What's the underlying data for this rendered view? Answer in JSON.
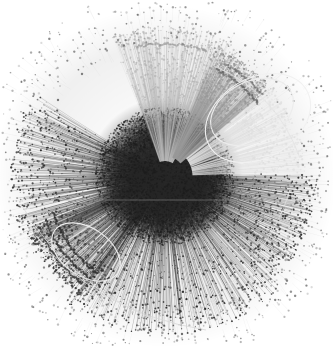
{
  "figure": {
    "type": "network-graph",
    "title": "",
    "caption": "",
    "background_color": "#ffffff",
    "width": 333,
    "height": 347
  },
  "chart_data": {
    "type": "scatter",
    "title": "",
    "subtitle": "",
    "xlabel": "",
    "ylabel": "",
    "xlim": [
      0,
      333
    ],
    "ylim": [
      0,
      347
    ],
    "grid": false,
    "legend_position": "none",
    "layout": "radial-force-directed-hairball",
    "node_count_estimate": 9000,
    "edge_count_estimate": 26000,
    "center": {
      "x": 165,
      "y": 176
    },
    "core_radius": 66,
    "outer_radius": 162,
    "colors": {
      "background": "#ffffff",
      "core_dark": "#262626",
      "node_dark": "#1c1c1c",
      "node_mid": "#555555",
      "node_light": "#b4b4b4",
      "edge_dark": "#3a3a3a",
      "edge_light": "#c9c9c9",
      "halo_faint": "#e4e4e4",
      "crescent_faint": "#ededed"
    },
    "clusters": [
      {
        "name": "dense-core",
        "angle_start": 0,
        "angle_end": 360,
        "radius_in": 0,
        "radius_out": 66,
        "tone": "#262626",
        "density": 1.0,
        "node_size": 0.85
      },
      {
        "name": "north-light-fan",
        "angle_start": 250,
        "angle_end": 300,
        "radius_in": 30,
        "radius_out": 150,
        "tone": "#b9b9b9",
        "density": 0.55,
        "node_size": 0.9
      },
      {
        "name": "north-east-light-fan",
        "angle_start": 292,
        "angle_end": 320,
        "radius_in": 40,
        "radius_out": 138,
        "tone": "#9a9a9a",
        "density": 0.5,
        "node_size": 0.9
      },
      {
        "name": "east-crescent-faint",
        "angle_start": 320,
        "angle_end": 358,
        "radius_in": 55,
        "radius_out": 140,
        "tone": "#e0e0e0",
        "density": 0.22,
        "node_size": 0.8
      },
      {
        "name": "west-dark-fan",
        "angle_start": 150,
        "angle_end": 210,
        "radius_in": 30,
        "radius_out": 155,
        "tone": "#303030",
        "density": 0.85,
        "node_size": 0.9
      },
      {
        "name": "south-west-comb",
        "angle_start": 120,
        "angle_end": 160,
        "radius_in": 60,
        "radius_out": 148,
        "tone": "#3a3a3a",
        "density": 0.8,
        "node_size": 0.95
      },
      {
        "name": "south-dark-fan",
        "angle_start": 45,
        "angle_end": 130,
        "radius_in": 30,
        "radius_out": 160,
        "tone": "#2c2c2c",
        "density": 0.9,
        "node_size": 0.9
      },
      {
        "name": "east-dark-fan",
        "angle_start": 0,
        "angle_end": 45,
        "radius_in": 30,
        "radius_out": 152,
        "tone": "#2e2e2e",
        "density": 0.85,
        "node_size": 0.9
      }
    ],
    "arc_bands": [
      {
        "name": "sw-comb-band-1",
        "cx": 165,
        "cy": 176,
        "r": 118,
        "angle_start": 125,
        "angle_end": 162,
        "count": 58,
        "tone": "#2e2e2e"
      },
      {
        "name": "sw-comb-band-2",
        "cx": 165,
        "cy": 176,
        "r": 127,
        "angle_start": 126,
        "angle_end": 160,
        "count": 54,
        "tone": "#343434"
      },
      {
        "name": "sw-comb-band-3",
        "cx": 165,
        "cy": 176,
        "r": 136,
        "angle_start": 128,
        "angle_end": 158,
        "count": 48,
        "tone": "#3a3a3a"
      },
      {
        "name": "ne-band-1",
        "cx": 165,
        "cy": 176,
        "r": 118,
        "angle_start": 296,
        "angle_end": 322,
        "count": 42,
        "tone": "#6a6a6a"
      },
      {
        "name": "ne-band-2",
        "cx": 165,
        "cy": 176,
        "r": 127,
        "angle_start": 298,
        "angle_end": 320,
        "count": 38,
        "tone": "#757575"
      },
      {
        "name": "n-band-1",
        "cx": 165,
        "cy": 176,
        "r": 132,
        "angle_start": 258,
        "angle_end": 288,
        "count": 44,
        "tone": "#9e9e9e"
      }
    ],
    "crescents": [
      {
        "name": "east-lens",
        "cx": 252,
        "cy": 112,
        "rx": 44,
        "ry": 30,
        "rotation": -28,
        "stroke": "#ececec"
      },
      {
        "name": "east-lens-outer",
        "cx": 258,
        "cy": 118,
        "rx": 56,
        "ry": 40,
        "rotation": -30,
        "stroke": "#f1f1f1"
      },
      {
        "name": "sw-lens",
        "cx": 86,
        "cy": 252,
        "rx": 38,
        "ry": 24,
        "rotation": 34,
        "stroke": "#eeeeee"
      }
    ],
    "horizontal_streak": {
      "name": "equatorial-light-line",
      "y": 200,
      "x_start": 62,
      "x_end": 282,
      "color": "#9e9e9e",
      "opacity": 0.55
    },
    "long_arcs": [
      {
        "name": "sw-long-arc",
        "from": [
          28,
          226
        ],
        "ctrl": [
          92,
          312
        ],
        "to": [
          206,
          330
        ],
        "stroke": "#d8d8d8"
      },
      {
        "name": "w-long-arc",
        "from": [
          22,
          206
        ],
        "ctrl": [
          70,
          286
        ],
        "to": [
          160,
          322
        ],
        "stroke": "#dcdcdc"
      },
      {
        "name": "ne-long-arc",
        "from": [
          214,
          66
        ],
        "ctrl": [
          276,
          92
        ],
        "to": [
          300,
          158
        ],
        "stroke": "#e2e2e2"
      },
      {
        "name": "se-long-arc",
        "from": [
          290,
          190
        ],
        "ctrl": [
          268,
          262
        ],
        "to": [
          196,
          312
        ],
        "stroke": "#e0e0e0"
      }
    ],
    "outlier_nodes": [
      {
        "x": 46,
        "y": 128,
        "size": 1.3,
        "tone": "#4a4a4a"
      },
      {
        "x": 30,
        "y": 150,
        "size": 1.2,
        "tone": "#555555"
      },
      {
        "x": 24,
        "y": 206,
        "size": 1.2,
        "tone": "#4f4f4f"
      },
      {
        "x": 36,
        "y": 244,
        "size": 1.3,
        "tone": "#4a4a4a"
      },
      {
        "x": 70,
        "y": 282,
        "size": 1.2,
        "tone": "#5a5a5a"
      },
      {
        "x": 108,
        "y": 312,
        "size": 1.2,
        "tone": "#5a5a5a"
      },
      {
        "x": 150,
        "y": 330,
        "size": 1.3,
        "tone": "#505050"
      },
      {
        "x": 182,
        "y": 334,
        "size": 1.2,
        "tone": "#555555"
      },
      {
        "x": 212,
        "y": 318,
        "size": 1.2,
        "tone": "#5a5a5a"
      },
      {
        "x": 262,
        "y": 286,
        "size": 1.2,
        "tone": "#606060"
      },
      {
        "x": 300,
        "y": 232,
        "size": 1.3,
        "tone": "#555555"
      },
      {
        "x": 312,
        "y": 188,
        "size": 1.2,
        "tone": "#5a5a5a"
      },
      {
        "x": 304,
        "y": 146,
        "size": 1.2,
        "tone": "#626262"
      },
      {
        "x": 286,
        "y": 88,
        "size": 1.2,
        "tone": "#6a6a6a"
      },
      {
        "x": 240,
        "y": 52,
        "size": 1.2,
        "tone": "#707070"
      },
      {
        "x": 196,
        "y": 24,
        "size": 1.1,
        "tone": "#8a8a8a"
      },
      {
        "x": 152,
        "y": 18,
        "size": 1.1,
        "tone": "#909090"
      },
      {
        "x": 118,
        "y": 40,
        "size": 1.2,
        "tone": "#808080"
      },
      {
        "x": 82,
        "y": 74,
        "size": 1.2,
        "tone": "#6a6a6a"
      },
      {
        "x": 58,
        "y": 100,
        "size": 1.2,
        "tone": "#606060"
      }
    ],
    "render_seed": 20240517
  }
}
